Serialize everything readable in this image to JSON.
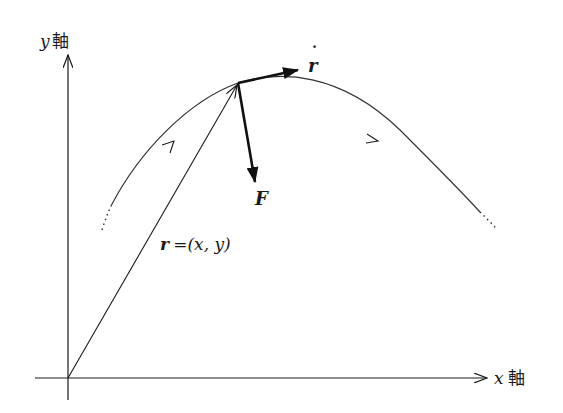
{
  "diagram": {
    "colors": {
      "ink": "#1a1a1a",
      "curve": "#333333",
      "background": "#ffffff"
    },
    "axes": {
      "x": {
        "var": "x",
        "label": "軸"
      },
      "y": {
        "var": "y",
        "label": "軸"
      }
    },
    "labels": {
      "position_vector": {
        "bold": "r",
        "rest": "=(x, y)"
      },
      "velocity": {
        "symbol": "r",
        "accent": "˙"
      },
      "force": {
        "symbol": "F"
      }
    },
    "elements": [
      "x-axis",
      "y-axis",
      "trajectory-curve",
      "position-vector",
      "velocity-vector",
      "force-vector"
    ]
  }
}
